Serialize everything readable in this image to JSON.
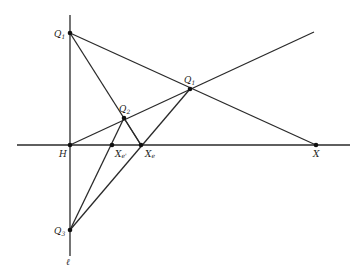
{
  "figure": {
    "type": "geometric-construction",
    "line_label": "ℓ",
    "points": {
      "Q1": {
        "label": "Q",
        "sub": "1"
      },
      "Q1p": {
        "label": "Q",
        "sub": "1"
      },
      "Q2": {
        "label": "Q",
        "sub": "2"
      },
      "Q3": {
        "label": "Q",
        "sub": "3"
      },
      "H": {
        "label": "H"
      },
      "X": {
        "label": "X"
      },
      "Xe": {
        "label": "X",
        "sub": "e"
      },
      "Xep": {
        "label": "X",
        "sub": "e'"
      }
    },
    "colors": {
      "stroke": "#2a2a2a",
      "point": "#111111",
      "background": "#ffffff"
    }
  }
}
